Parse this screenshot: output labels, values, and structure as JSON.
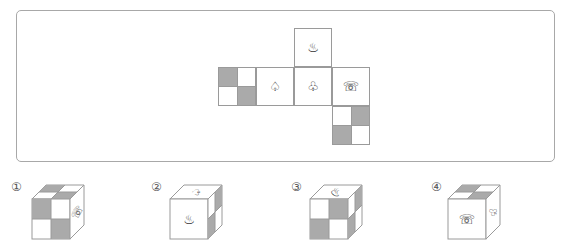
{
  "puzzle": {
    "type": "cube-net-folding",
    "colors": {
      "shade": "#aaaaaa",
      "line": "#9a9a9a",
      "frame": "#a8a8a8"
    },
    "net": {
      "faces": [
        {
          "id": "top-flap",
          "content": "hot-spring-icon",
          "glyph": "♨"
        },
        {
          "id": "checker-left",
          "content": "checker",
          "pattern": "shaded top-left, bottom-right"
        },
        {
          "id": "spade",
          "content": "spade-icon",
          "glyph": "♤"
        },
        {
          "id": "club",
          "content": "club-icon",
          "glyph": "♧"
        },
        {
          "id": "telephone",
          "content": "telephone-icon",
          "glyph": "☏"
        },
        {
          "id": "checker-bottom",
          "content": "checker",
          "pattern": "shaded top-right, bottom-left"
        }
      ]
    },
    "options": [
      {
        "label": "①",
        "front": "checker",
        "top": "checker",
        "right": "telephone-icon (rotated)"
      },
      {
        "label": "②",
        "front": "hot-spring-icon",
        "top": "spade-icon (rotated)",
        "right": "checker"
      },
      {
        "label": "③",
        "front": "checker",
        "top": "hot-spring-icon (rotated)",
        "right": "checker"
      },
      {
        "label": "④",
        "front": "telephone-icon",
        "top": "checker",
        "right": "club-icon (rotated)"
      }
    ]
  },
  "glyphs": {
    "hot_spring": "♨",
    "spade": "♤",
    "club": "♧",
    "telephone": "☏"
  },
  "labels": [
    "①",
    "②",
    "③",
    "④"
  ]
}
